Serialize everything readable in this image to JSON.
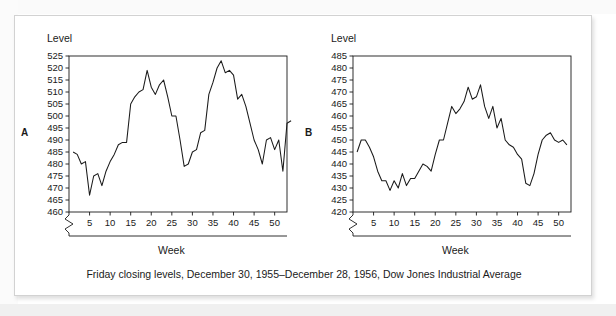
{
  "figure": {
    "caption": "Friday closing levels, December 30, 1955–December 28, 1956, Dow Jones Industrial Average"
  },
  "panels": [
    {
      "letter": "A",
      "ylabel": "Level",
      "xlabel": "Week"
    },
    {
      "letter": "B",
      "ylabel": "Level",
      "xlabel": "Week"
    }
  ],
  "chart_data": [
    {
      "type": "line",
      "panel": "A",
      "title": "",
      "xlabel": "Week",
      "ylabel": "Level",
      "xlim": [
        0,
        53
      ],
      "ylim": [
        460,
        525
      ],
      "axis_break_y": true,
      "grid": false,
      "legend": "none",
      "xticks": [
        5,
        10,
        15,
        20,
        25,
        30,
        35,
        40,
        45,
        50
      ],
      "yticks": [
        460,
        465,
        470,
        475,
        480,
        485,
        490,
        495,
        500,
        505,
        510,
        515,
        520,
        525
      ],
      "x": [
        1,
        2,
        3,
        4,
        5,
        6,
        7,
        8,
        9,
        10,
        11,
        12,
        13,
        14,
        15,
        16,
        17,
        18,
        19,
        20,
        21,
        22,
        23,
        24,
        25,
        26,
        27,
        28,
        29,
        30,
        31,
        32,
        33,
        34,
        35,
        36,
        37,
        38,
        39,
        40,
        41,
        42,
        43,
        44,
        45,
        46,
        47,
        48,
        49,
        50,
        51,
        52
      ],
      "values": [
        485,
        484,
        480,
        481,
        467,
        475,
        476,
        471,
        477,
        481,
        484,
        488,
        489,
        489,
        505,
        508,
        510,
        511,
        519,
        512,
        509,
        513,
        515,
        508,
        500,
        500,
        490,
        479,
        480,
        485,
        486,
        493,
        494,
        509,
        514,
        520,
        523,
        518,
        519,
        517,
        507,
        509,
        504,
        497,
        490,
        486,
        480,
        490,
        491,
        486,
        490,
        477,
        497,
        498
      ],
      "series": [
        {
          "name": "Dow Jones Industrial Average",
          "values": [
            485,
            484,
            480,
            481,
            467,
            475,
            476,
            471,
            477,
            481,
            484,
            488,
            489,
            489,
            505,
            508,
            510,
            511,
            519,
            512,
            509,
            513,
            515,
            508,
            500,
            500,
            490,
            479,
            480,
            485,
            486,
            493,
            494,
            509,
            514,
            520,
            523,
            518,
            519,
            517,
            507,
            509,
            504,
            497,
            490,
            486,
            480,
            490,
            491,
            486,
            490,
            477,
            497,
            498
          ]
        }
      ]
    },
    {
      "type": "line",
      "panel": "B",
      "title": "",
      "xlabel": "Week",
      "ylabel": "Level",
      "xlim": [
        0,
        53
      ],
      "ylim": [
        420,
        485
      ],
      "axis_break_y": true,
      "grid": false,
      "legend": "none",
      "xticks": [
        5,
        10,
        15,
        20,
        25,
        30,
        35,
        40,
        45,
        50
      ],
      "yticks": [
        420,
        425,
        430,
        435,
        440,
        445,
        450,
        455,
        460,
        465,
        470,
        475,
        480,
        485
      ],
      "x": [
        1,
        2,
        3,
        4,
        5,
        6,
        7,
        8,
        9,
        10,
        11,
        12,
        13,
        14,
        15,
        16,
        17,
        18,
        19,
        20,
        21,
        22,
        23,
        24,
        25,
        26,
        27,
        28,
        29,
        30,
        31,
        32,
        33,
        34,
        35,
        36,
        37,
        38,
        39,
        40,
        41,
        42,
        43,
        44,
        45,
        46,
        47,
        48,
        49,
        50,
        51,
        52
      ],
      "values": [
        445,
        450,
        450,
        447,
        443,
        437,
        433,
        433,
        429,
        433,
        430,
        436,
        431,
        434,
        434,
        437,
        440,
        439,
        437,
        444,
        450,
        450,
        457,
        464,
        461,
        463,
        466,
        472,
        467,
        468,
        473,
        464,
        459,
        464,
        455,
        459,
        450,
        448,
        447,
        444,
        442,
        432,
        431,
        436,
        444,
        450,
        452,
        453,
        450,
        449,
        450,
        448
      ],
      "series": [
        {
          "name": "Dow Jones Industrial Average",
          "values": [
            445,
            450,
            450,
            447,
            443,
            437,
            433,
            433,
            429,
            433,
            430,
            436,
            431,
            434,
            434,
            437,
            440,
            439,
            437,
            444,
            450,
            450,
            457,
            464,
            461,
            463,
            466,
            472,
            467,
            468,
            473,
            464,
            459,
            464,
            455,
            459,
            450,
            448,
            447,
            444,
            442,
            432,
            431,
            436,
            444,
            450,
            452,
            453,
            450,
            449,
            450,
            448
          ]
        }
      ]
    }
  ]
}
